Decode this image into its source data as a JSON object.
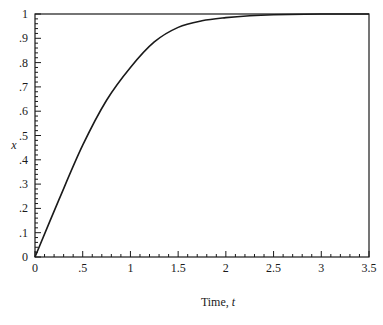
{
  "chart_data": {
    "type": "line",
    "title": "",
    "xlabel": "Time, t",
    "xlabel_text": "Time, ",
    "xlabel_var": "t",
    "ylabel": "x",
    "xlim": [
      0,
      3.5
    ],
    "ylim": [
      0,
      1
    ],
    "grid": false,
    "legend": null,
    "x_ticks": [
      0,
      0.5,
      1,
      1.5,
      2,
      2.5,
      3,
      3.5
    ],
    "x_tick_labels": [
      "0",
      ".5",
      "1",
      "1.5",
      "2",
      "2.5",
      "3",
      "3.5"
    ],
    "y_ticks": [
      0,
      0.1,
      0.2,
      0.3,
      0.4,
      0.5,
      0.6,
      0.7,
      0.8,
      0.9,
      1
    ],
    "y_tick_labels": [
      "0",
      ".1",
      ".2",
      ".3",
      ".4",
      ".5",
      ".6",
      ".7",
      ".8",
      ".9",
      "1"
    ],
    "series": [
      {
        "name": "x(t)",
        "color": "#1a1a1a",
        "x": [
          0,
          0.25,
          0.5,
          0.75,
          1.0,
          1.25,
          1.5,
          1.75,
          2.0,
          2.25,
          2.5,
          3.0,
          3.5
        ],
        "y": [
          0,
          0.235,
          0.46,
          0.645,
          0.78,
          0.885,
          0.945,
          0.972,
          0.985,
          0.993,
          0.997,
          1.0,
          1.0
        ]
      }
    ]
  },
  "colors": {
    "axis": "#1a1a1a",
    "background": "#ffffff"
  }
}
